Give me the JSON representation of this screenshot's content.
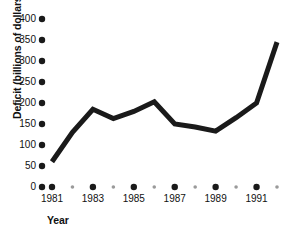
{
  "chart_data": {
    "type": "line",
    "title": "",
    "subtitle": "",
    "xlabel": "Year",
    "ylabel": "Deficit (billions of dollars)",
    "x": [
      1981,
      1982,
      1983,
      1984,
      1985,
      1986,
      1987,
      1988,
      1989,
      1990,
      1991,
      1992
    ],
    "values": [
      60,
      130,
      185,
      163,
      180,
      203,
      150,
      143,
      133,
      165,
      200,
      345
    ],
    "series": [
      {
        "name": "Deficit",
        "values": [
          60,
          130,
          185,
          163,
          180,
          203,
          150,
          143,
          133,
          165,
          200,
          345
        ]
      }
    ],
    "xlim": [
      1981,
      1992
    ],
    "ylim": [
      0,
      400
    ],
    "yticks": [
      0,
      50,
      100,
      150,
      200,
      250,
      300,
      350,
      400
    ],
    "ytick_labels": [
      "0",
      "50",
      "100",
      "150",
      "200",
      "250",
      "300",
      "350",
      "400"
    ],
    "xticks": [
      1981,
      1982,
      1983,
      1984,
      1985,
      1986,
      1987,
      1988,
      1989,
      1990,
      1991,
      1992
    ],
    "xtick_labels": [
      "1981",
      "",
      "1983",
      "",
      "1985",
      "",
      "1987",
      "",
      "1989",
      "",
      "1991",
      ""
    ],
    "grid": false,
    "legend": "none",
    "line_color": "#1a1a1a",
    "line_width": 5,
    "major_tick_color": "#1a1a1a",
    "minor_tick_color": "#9a9a9a",
    "background_color": "#ffffff"
  },
  "axes": {
    "y_title": "Deficit (billions of dollars)",
    "x_title": "Year"
  },
  "ticks": {
    "y": [
      {
        "label": "400",
        "value": 400
      },
      {
        "label": "350",
        "value": 350
      },
      {
        "label": "300",
        "value": 300
      },
      {
        "label": "250",
        "value": 250
      },
      {
        "label": "200",
        "value": 200
      },
      {
        "label": "150",
        "value": 150
      },
      {
        "label": "100",
        "value": 100
      },
      {
        "label": "50",
        "value": 50
      },
      {
        "label": "0",
        "value": 0
      }
    ],
    "x": [
      {
        "label": "1981",
        "value": 1981,
        "major": true
      },
      {
        "label": "",
        "value": 1982,
        "major": false
      },
      {
        "label": "1983",
        "value": 1983,
        "major": true
      },
      {
        "label": "",
        "value": 1984,
        "major": false
      },
      {
        "label": "1985",
        "value": 1985,
        "major": true
      },
      {
        "label": "",
        "value": 1986,
        "major": false
      },
      {
        "label": "1987",
        "value": 1987,
        "major": true
      },
      {
        "label": "",
        "value": 1988,
        "major": false
      },
      {
        "label": "1989",
        "value": 1989,
        "major": true
      },
      {
        "label": "",
        "value": 1990,
        "major": false
      },
      {
        "label": "1991",
        "value": 1991,
        "major": true
      },
      {
        "label": "",
        "value": 1992,
        "major": false
      }
    ]
  }
}
